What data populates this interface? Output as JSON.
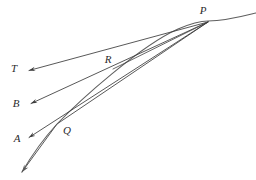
{
  "figure": {
    "kind": "geometry-diagram",
    "canvas": {
      "width": 256,
      "height": 180,
      "background": "#ffffff"
    },
    "style": {
      "stroke_color": "#3a3a3a",
      "curve_color": "#555555",
      "stroke_width": 0.9,
      "label_color": "#2b2b2b",
      "label_font_size": 11
    },
    "points": [
      {
        "name": "P",
        "label": "P",
        "label_x": 203,
        "label_y": 10,
        "x": 208,
        "y": 22
      },
      {
        "name": "R",
        "label": "R",
        "label_x": 108,
        "label_y": 59,
        "x": 113,
        "y": 69
      },
      {
        "name": "Q",
        "label": "Q",
        "label_x": 67,
        "label_y": 130,
        "x": 57,
        "y": 124
      },
      {
        "name": "T",
        "label": "T",
        "label_x": 14,
        "label_y": 68,
        "x": 28,
        "y": 71
      },
      {
        "name": "B",
        "label": "B",
        "label_x": 16,
        "label_y": 103,
        "x": 30,
        "y": 104
      },
      {
        "name": "A",
        "label": "A",
        "label_x": 17,
        "label_y": 138,
        "x": 28,
        "y": 138
      }
    ],
    "rays": [
      {
        "name": "ray-to-T",
        "from": "P",
        "to": "T",
        "arrowhead": true
      },
      {
        "name": "ray-to-B",
        "from": "P",
        "through": "R",
        "to": "B",
        "arrowhead": true
      },
      {
        "name": "ray-to-A",
        "from": "P",
        "through": "Q",
        "to": "A",
        "arrowhead": true
      },
      {
        "name": "ray-through-Q-down",
        "from": "P",
        "through": "Q",
        "to": "bottom-left",
        "arrowhead": true
      }
    ],
    "curve": {
      "name": "curve",
      "passes_through": "P",
      "start_x": 22,
      "start_y": 172,
      "end_x": 256,
      "end_y": 13
    }
  }
}
